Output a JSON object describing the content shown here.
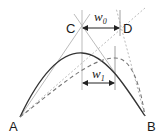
{
  "diagram": {
    "points": {
      "A": {
        "label": "A"
      },
      "B": {
        "label": "B"
      },
      "C": {
        "label": "C"
      },
      "D": {
        "label": "D"
      }
    },
    "dimensions": {
      "w0": {
        "symbol": "w",
        "subscript": "0"
      },
      "w1": {
        "symbol": "w",
        "subscript": "1"
      }
    },
    "curves": {
      "solid": "solid arc A-B peaking below C",
      "dashed": "dashed skewed arc A-B peaking toward D"
    },
    "colors": {
      "stroke": "#333333",
      "guide": "#999999",
      "dashed": "#777777"
    }
  }
}
